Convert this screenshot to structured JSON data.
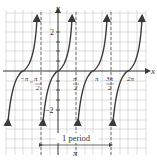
{
  "figure": {
    "function": "y = tan x",
    "axis_labels": {
      "x": "x",
      "y": "y"
    },
    "y_ticks": [
      {
        "value": 2,
        "label": "2"
      },
      {
        "value": -2,
        "label": "−2"
      }
    ],
    "x_ticks": [
      {
        "value": "-π",
        "label": "−π"
      },
      {
        "value": "-π/2",
        "num": "π",
        "den": "2",
        "sign": "−"
      },
      {
        "value": "π/2",
        "num": "π",
        "den": "2",
        "sign": ""
      },
      {
        "value": "π",
        "label": "π"
      },
      {
        "value": "3π/2",
        "num": "3π",
        "den": "2",
        "sign": ""
      },
      {
        "value": "2π",
        "label": "2π"
      }
    ],
    "asymptotes": [
      "-π/2",
      "π/2",
      "3π/2"
    ],
    "period_annotation": {
      "label": "1 period",
      "value": "π"
    },
    "colors": {
      "curve": "#3a3a3a",
      "grid": "#c8c8c8",
      "axis": "#333333",
      "asymptote": "#555555"
    }
  }
}
